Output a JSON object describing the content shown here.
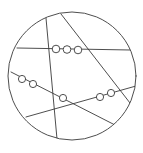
{
  "diagram": {
    "width": 143,
    "height": 153,
    "stroke_color": "#3a3a3a",
    "background": "#ffffff",
    "outer_circle": {
      "cx": 72,
      "cy": 76,
      "r": 64
    },
    "lines": [
      {
        "id": "line-a-horizontal-top",
        "x1": 17,
        "y1": 48,
        "x2": 130,
        "y2": 50
      },
      {
        "id": "line-b-near-vertical",
        "x1": 46,
        "y1": 18,
        "x2": 57,
        "y2": 139
      },
      {
        "id": "line-c-diagonal",
        "x1": 61,
        "y1": 14,
        "x2": 130,
        "y2": 103
      },
      {
        "id": "line-d-descending",
        "x1": 11,
        "y1": 72,
        "x2": 115,
        "y2": 125
      },
      {
        "id": "line-e-ascending",
        "x1": 26,
        "y1": 117,
        "x2": 136,
        "y2": 86
      }
    ],
    "beads": [
      {
        "line": "line-a-horizontal-top",
        "cx": 56,
        "cy": 49,
        "r": 3.8
      },
      {
        "line": "line-a-horizontal-top",
        "cx": 67,
        "cy": 49.5,
        "r": 3.8
      },
      {
        "line": "line-a-horizontal-top",
        "cx": 78,
        "cy": 50,
        "r": 3.8
      },
      {
        "line": "line-d-descending",
        "cx": 22,
        "cy": 79,
        "r": 3.6
      },
      {
        "line": "line-d-descending",
        "cx": 33,
        "cy": 84,
        "r": 3.6
      },
      {
        "line": "line-d-descending",
        "cx": 63,
        "cy": 98,
        "r": 3.6
      },
      {
        "line": "line-e-ascending",
        "cx": 100,
        "cy": 97,
        "r": 3.6
      },
      {
        "line": "line-e-ascending",
        "cx": 111,
        "cy": 93,
        "r": 3.6
      }
    ]
  }
}
